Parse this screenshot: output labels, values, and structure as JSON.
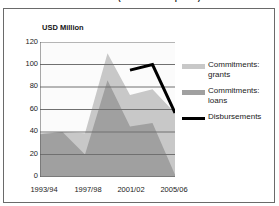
{
  "title": "1990-2006 (2006 constant prices)",
  "axis_label": "USD Million",
  "y_ticks": [
    "120",
    "100",
    "80",
    "60",
    "40",
    "20",
    "0"
  ],
  "x_ticks": [
    "1993/94",
    "1997/98",
    "2001/02",
    "2005/06"
  ],
  "legend": [
    {
      "label_line1": "Commitments:",
      "label_line2": "grants",
      "color": "#c8c8c8",
      "type": "area"
    },
    {
      "label_line1": "Commitments:",
      "label_line2": "loans",
      "color": "#a0a0a0",
      "type": "area"
    },
    {
      "label_line1": "Disbursements",
      "label_line2": "",
      "color": "#000000",
      "type": "line"
    }
  ],
  "chart_data": {
    "type": "area",
    "title": "1990-2006 (2006 constant prices)",
    "xlabel": "",
    "ylabel": "USD Million",
    "ylim": [
      0,
      120
    ],
    "yticks": [
      0,
      20,
      40,
      60,
      80,
      100,
      120
    ],
    "grid": true,
    "legend_position": "right",
    "stacked": true,
    "x": [
      "1993/94",
      "1995/96",
      "1997/98",
      "1999/00",
      "2001/02",
      "2003/04",
      "2005/06"
    ],
    "x_tick_labels": [
      "1993/94",
      "1997/98",
      "2001/02",
      "2005/06"
    ],
    "series": [
      {
        "name": "Commitments: loans",
        "color": "#a0a0a0",
        "type": "area",
        "values": [
          38,
          40,
          20,
          86,
          45,
          48,
          2
        ]
      },
      {
        "name": "Commitments: grants",
        "color": "#c8c8c8",
        "type": "area",
        "values": [
          1,
          0,
          19,
          24,
          28,
          30,
          55
        ]
      },
      {
        "name": "Commitments: total",
        "color": "#c8c8c8",
        "type": "area-top",
        "values": [
          39,
          40,
          39,
          110,
          73,
          78,
          57
        ]
      },
      {
        "name": "Disbursements",
        "color": "#000000",
        "type": "line",
        "values": [
          null,
          null,
          null,
          null,
          95,
          100,
          57
        ]
      }
    ]
  }
}
